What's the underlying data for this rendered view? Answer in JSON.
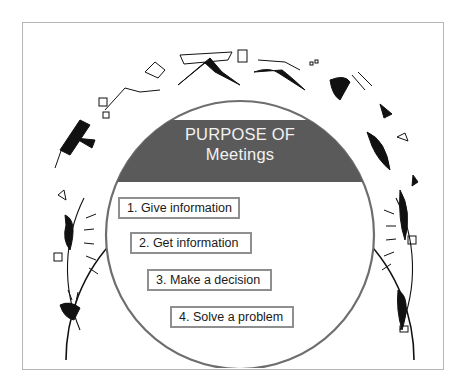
{
  "diagram": {
    "title_line1": "PURPOSE OF",
    "title_line2": "Meetings",
    "items": [
      {
        "label": "1. Give information"
      },
      {
        "label": "2. Get information"
      },
      {
        "label": "3. Make a decision"
      },
      {
        "label": "4. Solve a problem"
      }
    ],
    "decorations": "Cartoon figures of people running/leaping around the outer arc carrying flags, banners and papers",
    "colors": {
      "band": "#5a5a5a",
      "title_text": "#f2f2f2",
      "inner_arc": "#6e6e6e",
      "outer_arc": "#111111",
      "item_border": "#8f8f8f",
      "frame_border": "#b5b5b5"
    }
  }
}
